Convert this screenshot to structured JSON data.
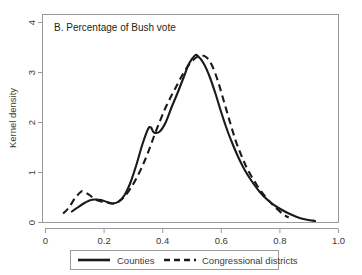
{
  "chart_data": {
    "type": "line",
    "title": "B. Percentage of Bush vote",
    "xlabel": "",
    "ylabel": "Kernel density",
    "xlim": [
      0,
      1.0
    ],
    "ylim": [
      0,
      4
    ],
    "xticks": [
      "0",
      "0.2",
      "0.4",
      "0.6",
      "0.8",
      "1.0"
    ],
    "xtick_values": [
      0,
      0.2,
      0.4,
      0.6,
      0.8,
      1.0
    ],
    "yticks": [
      "0",
      "1",
      "2",
      "3",
      "4"
    ],
    "ytick_values": [
      0,
      1,
      2,
      3,
      4
    ],
    "grid": false,
    "legend_position": "below-axes",
    "series": [
      {
        "name": "Counties",
        "style": "solid",
        "color": "#1a1a1a",
        "x": [
          0.09,
          0.11,
          0.13,
          0.15,
          0.17,
          0.19,
          0.21,
          0.23,
          0.25,
          0.27,
          0.29,
          0.31,
          0.33,
          0.35,
          0.36,
          0.37,
          0.39,
          0.41,
          0.43,
          0.45,
          0.47,
          0.49,
          0.51,
          0.52,
          0.54,
          0.56,
          0.58,
          0.6,
          0.62,
          0.64,
          0.66,
          0.68,
          0.7,
          0.73,
          0.76,
          0.79,
          0.82,
          0.85,
          0.88,
          0.92
        ],
        "y": [
          0.22,
          0.3,
          0.38,
          0.44,
          0.46,
          0.45,
          0.41,
          0.38,
          0.42,
          0.55,
          0.8,
          1.15,
          1.55,
          1.87,
          1.9,
          1.8,
          1.82,
          2.0,
          2.3,
          2.58,
          2.88,
          3.18,
          3.34,
          3.33,
          3.18,
          2.92,
          2.58,
          2.2,
          1.85,
          1.55,
          1.28,
          1.05,
          0.86,
          0.62,
          0.44,
          0.31,
          0.21,
          0.13,
          0.07,
          0.03
        ]
      },
      {
        "name": "Congressional districts",
        "style": "dashed",
        "color": "#1a1a1a",
        "x": [
          0.06,
          0.08,
          0.1,
          0.12,
          0.13,
          0.15,
          0.17,
          0.19,
          0.21,
          0.23,
          0.25,
          0.27,
          0.29,
          0.31,
          0.33,
          0.35,
          0.37,
          0.39,
          0.41,
          0.43,
          0.45,
          0.47,
          0.49,
          0.51,
          0.53,
          0.55,
          0.57,
          0.59,
          0.61,
          0.63,
          0.65,
          0.67,
          0.69,
          0.72,
          0.75,
          0.78,
          0.81,
          0.83
        ],
        "y": [
          0.18,
          0.3,
          0.48,
          0.61,
          0.62,
          0.55,
          0.46,
          0.42,
          0.4,
          0.38,
          0.42,
          0.52,
          0.68,
          0.88,
          1.12,
          1.4,
          1.72,
          2.02,
          2.3,
          2.54,
          2.76,
          2.98,
          3.16,
          3.28,
          3.34,
          3.3,
          3.12,
          2.8,
          2.4,
          2.0,
          1.62,
          1.32,
          1.06,
          0.76,
          0.52,
          0.33,
          0.17,
          0.1
        ]
      }
    ]
  },
  "axes": {
    "y_title": "Kernel density",
    "panel_label": "B. Percentage of Bush vote"
  },
  "legend": {
    "items": [
      {
        "label": "Counties",
        "style": "solid"
      },
      {
        "label": "Congressional districts",
        "style": "dashed"
      }
    ]
  }
}
